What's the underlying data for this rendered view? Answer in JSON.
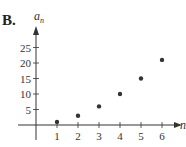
{
  "panel_label": "B.",
  "chart_data": {
    "type": "scatter",
    "title": "",
    "xlabel": "n",
    "ylabel": "a_n",
    "x": [
      1,
      2,
      3,
      4,
      5,
      6
    ],
    "values": [
      1,
      3,
      6,
      10,
      15,
      21
    ],
    "x_ticks": [
      "1",
      "2",
      "3",
      "4",
      "5",
      "6"
    ],
    "y_ticks": [
      "5",
      "10",
      "15",
      "20",
      "25"
    ],
    "xlim": [
      0,
      6.6
    ],
    "ylim": [
      0,
      28
    ],
    "grid": false,
    "legend": null
  },
  "colors": {
    "point": "#333333",
    "axis": "#333333"
  }
}
